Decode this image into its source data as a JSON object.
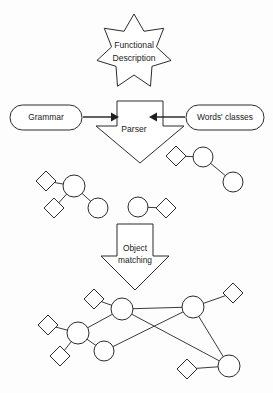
{
  "diagram": {
    "title_nodes": {
      "functional_description": {
        "line1": "Functional",
        "line2": "Description"
      },
      "grammar": "Grammar",
      "words_classes": "Words' classes",
      "parser": "Parser",
      "object_matching": {
        "line1": "Object",
        "line2": "matching"
      }
    },
    "colors": {
      "stroke": "#2b2b2b",
      "edge": "#3a3a3a",
      "fill": "#ffffff",
      "background": "#fdfdfd",
      "text": "#1a1a1a"
    },
    "shapes": {
      "star": {
        "name": "functional-description-star",
        "points": 7,
        "cx": 134,
        "cy": 52,
        "outer_r": 38,
        "inner_r": 23
      },
      "grammar_pill": {
        "x": 10,
        "y": 105,
        "w": 72,
        "h": 25,
        "rx": 12.5
      },
      "words_pill": {
        "x": 186,
        "y": 105,
        "w": 78,
        "h": 25,
        "rx": 12.5
      },
      "parser_arrow": {
        "x": 96,
        "y": 101,
        "w": 88,
        "h": 62,
        "shaft_w": 44
      },
      "matching_arrow": {
        "x": 101,
        "y": 224,
        "w": 68,
        "h": 66,
        "shaft_w": 36
      }
    },
    "arrows": [
      {
        "name": "grammar-to-parser",
        "from": "grammar",
        "to": "parser",
        "x1": 83,
        "y1": 117,
        "x2": 117,
        "y2": 117
      },
      {
        "name": "words-to-parser",
        "from": "words_classes",
        "to": "parser",
        "x1": 185,
        "y1": 117,
        "x2": 151,
        "y2": 117
      }
    ],
    "fragment_graphs": [
      {
        "name": "fragment-right-top",
        "nodes": [
          {
            "type": "diamond",
            "cx": 176,
            "cy": 156,
            "r": 10
          },
          {
            "type": "circle",
            "cx": 203,
            "cy": 157,
            "r": 10
          },
          {
            "type": "circle",
            "cx": 233,
            "cy": 182,
            "r": 10
          }
        ],
        "edges": [
          [
            0,
            1
          ],
          [
            1,
            2
          ]
        ]
      },
      {
        "name": "fragment-left",
        "nodes": [
          {
            "type": "diamond",
            "cx": 46,
            "cy": 181,
            "r": 10
          },
          {
            "type": "circle",
            "cx": 74,
            "cy": 186,
            "r": 11
          },
          {
            "type": "diamond",
            "cx": 54,
            "cy": 208,
            "r": 10
          },
          {
            "type": "circle",
            "cx": 98,
            "cy": 208,
            "r": 10
          }
        ],
        "edges": [
          [
            0,
            1
          ],
          [
            1,
            2
          ],
          [
            1,
            3
          ]
        ]
      },
      {
        "name": "fragment-middle",
        "nodes": [
          {
            "type": "circle",
            "cx": 138,
            "cy": 207,
            "r": 10
          },
          {
            "type": "diamond",
            "cx": 166,
            "cy": 208,
            "r": 10
          }
        ],
        "edges": [
          [
            0,
            1
          ]
        ]
      }
    ],
    "merged_graph": {
      "name": "merged-object-graph",
      "nodes": [
        {
          "id": 0,
          "type": "diamond",
          "cx": 94,
          "cy": 299,
          "r": 10
        },
        {
          "id": 1,
          "type": "circle",
          "cx": 122,
          "cy": 309,
          "r": 11
        },
        {
          "id": 2,
          "type": "diamond",
          "cx": 48,
          "cy": 325,
          "r": 10
        },
        {
          "id": 3,
          "type": "circle",
          "cx": 78,
          "cy": 333,
          "r": 11
        },
        {
          "id": 4,
          "type": "diamond",
          "cx": 60,
          "cy": 356,
          "r": 10
        },
        {
          "id": 5,
          "type": "circle",
          "cx": 104,
          "cy": 351,
          "r": 10
        },
        {
          "id": 6,
          "type": "circle",
          "cx": 193,
          "cy": 307,
          "r": 11
        },
        {
          "id": 7,
          "type": "diamond",
          "cx": 233,
          "cy": 293,
          "r": 10
        },
        {
          "id": 8,
          "type": "circle",
          "cx": 229,
          "cy": 366,
          "r": 11
        },
        {
          "id": 9,
          "type": "diamond",
          "cx": 187,
          "cy": 369,
          "r": 10
        }
      ],
      "edges": [
        [
          0,
          1
        ],
        [
          1,
          3
        ],
        [
          1,
          6
        ],
        [
          1,
          8
        ],
        [
          2,
          3
        ],
        [
          3,
          4
        ],
        [
          3,
          5
        ],
        [
          5,
          6
        ],
        [
          6,
          7
        ],
        [
          6,
          8
        ],
        [
          8,
          9
        ]
      ]
    }
  }
}
